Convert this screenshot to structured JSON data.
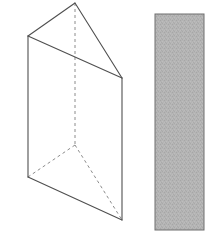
{
  "figure": {
    "background_color": "#ffffff",
    "canvas": {
      "width": 215,
      "height": 246
    },
    "styles": {
      "solid_edge_color": "#4f4f4f",
      "solid_edge_width": 1.1,
      "hidden_edge_color": "#8c8c8c",
      "hidden_edge_width": 1.0,
      "hidden_edge_dash": "3,3",
      "face_fill_color": "#ffffff"
    },
    "prism": {
      "name": "triangular-prism",
      "description": "Oblique triangular prism drawn with solid visible edges and dashed hidden edges",
      "vertices": {
        "top_apex_front": {
          "label": "A",
          "x": 75,
          "y": 3
        },
        "top_left": {
          "label": "B",
          "x": 28,
          "y": 36
        },
        "top_right": {
          "label": "C",
          "x": 122,
          "y": 78
        },
        "bottom_hidden_back": {
          "label": "D",
          "x": 75,
          "y": 145
        },
        "bottom_left": {
          "label": "E",
          "x": 28,
          "y": 177
        },
        "bottom_right": {
          "label": "F",
          "x": 122,
          "y": 220
        }
      },
      "solid_edges": [
        {
          "name": "top-face-left-edge",
          "from": "top_apex_front",
          "to": "top_left"
        },
        {
          "name": "top-face-right-edge",
          "from": "top_apex_front",
          "to": "top_right"
        },
        {
          "name": "top-face-front-edge",
          "from": "top_left",
          "to": "top_right"
        },
        {
          "name": "left-vertical-edge",
          "from": "top_left",
          "to": "bottom_left"
        },
        {
          "name": "right-vertical-edge",
          "from": "top_right",
          "to": "bottom_right"
        },
        {
          "name": "bottom-face-front-edge",
          "from": "bottom_left",
          "to": "bottom_right"
        }
      ],
      "hidden_edges": [
        {
          "name": "back-vertical-edge",
          "from": "top_apex_front",
          "to": "bottom_hidden_back"
        },
        {
          "name": "bottom-face-left-hidden-edge",
          "from": "bottom_hidden_back",
          "to": "bottom_left"
        },
        {
          "name": "bottom-face-right-hidden-edge",
          "from": "bottom_hidden_back",
          "to": "bottom_right"
        }
      ]
    },
    "shaded_rectangle": {
      "name": "shaded-rectangle",
      "description": "Gray shaded vertical rectangle representing a cross-section or face",
      "x": 155,
      "y": 14,
      "width": 49,
      "height": 216,
      "fill_color": "#b2b2b2",
      "border_color": "#6e6e6e",
      "border_width": 1,
      "texture": "dithered-noise"
    }
  }
}
